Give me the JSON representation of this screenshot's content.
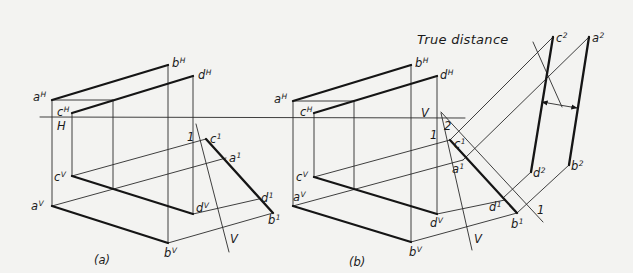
{
  "figure": {
    "annotation": "True distance",
    "caption_a": "(a)",
    "caption_b": "(b)",
    "ground_label_h": "H",
    "ground_label_v": "V"
  },
  "labels": [
    {
      "id": "a-aH",
      "base": "a",
      "sup": "H",
      "x": 33,
      "y": 101
    },
    {
      "id": "a-bH",
      "base": "b",
      "sup": "H",
      "x": 172,
      "y": 67
    },
    {
      "id": "a-dH",
      "base": "d",
      "sup": "H",
      "x": 198,
      "y": 79
    },
    {
      "id": "a-cH",
      "base": "c",
      "sup": "H",
      "x": 57,
      "y": 116
    },
    {
      "id": "a-ref-1",
      "base": "1",
      "sup": "",
      "x": 187,
      "y": 141
    },
    {
      "id": "a-c1",
      "base": "c",
      "sup": "1",
      "x": 210,
      "y": 143
    },
    {
      "id": "a-a1",
      "base": "a",
      "sup": "1",
      "x": 229,
      "y": 162
    },
    {
      "id": "a-d1",
      "base": "d",
      "sup": "1",
      "x": 261,
      "y": 202
    },
    {
      "id": "a-b1",
      "base": "b",
      "sup": "1",
      "x": 268,
      "y": 224
    },
    {
      "id": "a-cV",
      "base": "c",
      "sup": "V",
      "x": 54,
      "y": 181
    },
    {
      "id": "a-aV",
      "base": "a",
      "sup": "V",
      "x": 31,
      "y": 210
    },
    {
      "id": "a-dV",
      "base": "d",
      "sup": "V",
      "x": 196,
      "y": 212
    },
    {
      "id": "a-bV",
      "base": "b",
      "sup": "V",
      "x": 164,
      "y": 257
    },
    {
      "id": "a-ref-V",
      "base": "V",
      "sup": "",
      "x": 230,
      "y": 243
    },
    {
      "id": "b-aH",
      "base": "a",
      "sup": "H",
      "x": 274,
      "y": 103
    },
    {
      "id": "b-bH",
      "base": "b",
      "sup": "H",
      "x": 415,
      "y": 67
    },
    {
      "id": "b-dH",
      "base": "d",
      "sup": "H",
      "x": 440,
      "y": 79
    },
    {
      "id": "b-cH",
      "base": "c",
      "sup": "H",
      "x": 300,
      "y": 116
    },
    {
      "id": "b-ref-1",
      "base": "1",
      "sup": "",
      "x": 430,
      "y": 139
    },
    {
      "id": "b-ref-2",
      "base": "2",
      "sup": "",
      "x": 444,
      "y": 130
    },
    {
      "id": "b-c1",
      "base": "c",
      "sup": "1",
      "x": 454,
      "y": 148
    },
    {
      "id": "b-a1",
      "base": "a",
      "sup": "1",
      "x": 452,
      "y": 173
    },
    {
      "id": "b-d1",
      "base": "d",
      "sup": "1",
      "x": 489,
      "y": 211
    },
    {
      "id": "b-b1",
      "base": "b",
      "sup": "1",
      "x": 511,
      "y": 228
    },
    {
      "id": "b-cV",
      "base": "c",
      "sup": "V",
      "x": 296,
      "y": 181
    },
    {
      "id": "b-aV",
      "base": "a",
      "sup": "V",
      "x": 293,
      "y": 201
    },
    {
      "id": "b-dV",
      "base": "d",
      "sup": "V",
      "x": 430,
      "y": 227
    },
    {
      "id": "b-bV",
      "base": "b",
      "sup": "V",
      "x": 409,
      "y": 256
    },
    {
      "id": "b-ref-V",
      "base": "V",
      "sup": "",
      "x": 474,
      "y": 243
    },
    {
      "id": "b-c2",
      "base": "c",
      "sup": "2",
      "x": 556,
      "y": 42
    },
    {
      "id": "b-a2",
      "base": "a",
      "sup": "2",
      "x": 592,
      "y": 42
    },
    {
      "id": "b-d2",
      "base": "d",
      "sup": "2",
      "x": 533,
      "y": 177
    },
    {
      "id": "b-b2",
      "base": "b",
      "sup": "2",
      "x": 571,
      "y": 170
    },
    {
      "id": "b-ref-1b",
      "base": "1",
      "sup": "",
      "x": 537,
      "y": 214
    }
  ],
  "text_positions": {
    "annotation": {
      "x": 417,
      "y": 44
    },
    "caption_a": {
      "x": 94,
      "y": 264
    },
    "caption_b": {
      "x": 349,
      "y": 266
    },
    "ground_label_h": {
      "x": 57,
      "y": 130
    },
    "ground_label_v": {
      "x": 421,
      "y": 117
    }
  },
  "lines": {
    "thin": [
      [
        40,
        117,
        465,
        118
      ],
      [
        52,
        100,
        113,
        100
      ],
      [
        52,
        100,
        52,
        206
      ],
      [
        72,
        113,
        72,
        176
      ],
      [
        113,
        100,
        113,
        189
      ],
      [
        168,
        65,
        168,
        243
      ],
      [
        193,
        76,
        193,
        214
      ],
      [
        196,
        124,
        229,
        252
      ],
      [
        72,
        176,
        206,
        139
      ],
      [
        52,
        206,
        226,
        158
      ],
      [
        193,
        214,
        259,
        199
      ],
      [
        168,
        243,
        273,
        213
      ],
      [
        293,
        101,
        354,
        101
      ],
      [
        293,
        101,
        293,
        206
      ],
      [
        314,
        113,
        314,
        177
      ],
      [
        354,
        101,
        354,
        189
      ],
      [
        411,
        65,
        411,
        242
      ],
      [
        437,
        76,
        437,
        214
      ],
      [
        441,
        113,
        472,
        250
      ],
      [
        441,
        112,
        543,
        222
      ],
      [
        314,
        177,
        450,
        140
      ],
      [
        293,
        206,
        463,
        160
      ],
      [
        437,
        214,
        505,
        200
      ],
      [
        411,
        242,
        517,
        213
      ],
      [
        450,
        140,
        553,
        37
      ],
      [
        463,
        160,
        589,
        37
      ],
      [
        503,
        198,
        531,
        172
      ],
      [
        517,
        213,
        569,
        165
      ],
      [
        533,
        42,
        562,
        107
      ]
    ],
    "thick": [
      [
        52,
        100,
        168,
        65
      ],
      [
        72,
        113,
        193,
        76
      ],
      [
        52,
        206,
        168,
        243
      ],
      [
        72,
        176,
        193,
        214
      ],
      [
        206,
        139,
        273,
        213
      ],
      [
        293,
        101,
        411,
        65
      ],
      [
        314,
        113,
        437,
        76
      ],
      [
        293,
        206,
        411,
        242
      ],
      [
        314,
        177,
        437,
        214
      ],
      [
        450,
        140,
        517,
        213
      ],
      [
        553,
        37,
        531,
        172
      ],
      [
        589,
        37,
        569,
        165
      ]
    ],
    "dimension": [
      542,
      102,
      577,
      108
    ]
  }
}
